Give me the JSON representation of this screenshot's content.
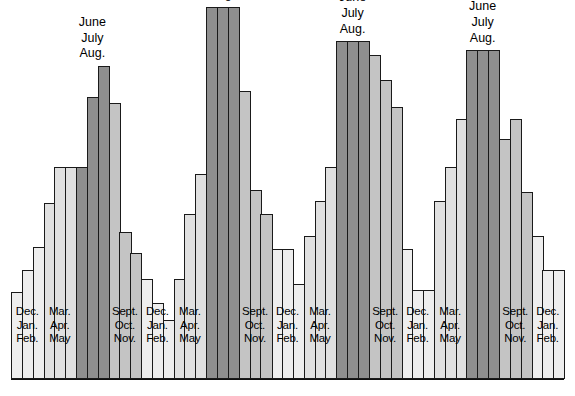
{
  "figure": {
    "title": "",
    "baseline_visible": true
  },
  "legend_colors": {
    "winter_dec_jan_feb": "#eeeeee",
    "spring_mar_apr_may": "#e0e0e0",
    "summer_jun_jul_aug": "#8f8f8f",
    "autumn_sept_oct_nov": "#c4c4c4",
    "outline": "#1a1a1a"
  },
  "season_labels": {
    "winter": [
      "Dec.",
      "Jan.",
      "Feb."
    ],
    "spring": [
      "Mar.",
      "Apr.",
      "May"
    ],
    "summer": [
      "June",
      "July",
      "Aug."
    ],
    "autumn": [
      "Sept.",
      "Oct.",
      "Nov."
    ]
  },
  "chart_data": {
    "type": "bar",
    "title": "",
    "xlabel": "",
    "ylabel": "",
    "ylim": [
      0,
      340
    ],
    "grid": false,
    "legend_position": "none",
    "note": "Monthly values grouped into seasonal quarters; summer quarters labeled above the bars.",
    "groups": [
      {
        "season": "winter",
        "label_lines": [
          "Dec.",
          "Jan.",
          "Feb."
        ],
        "label_position": "inside-bottom",
        "fill": "#eeeeee",
        "months": [
          "Dec.",
          "Jan.",
          "Feb."
        ],
        "values": [
          78,
          98,
          118
        ]
      },
      {
        "season": "spring",
        "label_lines": [
          "Mar.",
          "Apr.",
          "May"
        ],
        "label_position": "inside-bottom",
        "fill": "#e0e0e0",
        "months": [
          "Mar.",
          "Apr.",
          "May"
        ],
        "values": [
          158,
          190,
          190
        ]
      },
      {
        "season": "summer",
        "label_lines": [
          "June",
          "July",
          "Aug."
        ],
        "label_position": "top",
        "fill": "#8f8f8f",
        "months": [
          "June",
          "July",
          "Aug."
        ],
        "values": [
          190,
          253,
          281
        ]
      },
      {
        "season": "autumn",
        "label_lines": [
          "Sept.",
          "Oct.",
          "Nov."
        ],
        "label_position": "inside-bottom",
        "fill": "#c4c4c4",
        "months": [
          "Sept.",
          "Oct.",
          "Nov."
        ],
        "values": [
          248,
          132,
          113
        ]
      },
      {
        "season": "winter",
        "label_lines": [
          "Dec.",
          "Jan.",
          "Feb."
        ],
        "label_position": "inside-bottom",
        "fill": "#eeeeee",
        "months": [
          "Dec.",
          "Jan.",
          "Feb."
        ],
        "values": [
          90,
          68,
          53
        ]
      },
      {
        "season": "spring",
        "label_lines": [
          "Mar.",
          "Apr.",
          "May"
        ],
        "label_position": "inside-bottom",
        "fill": "#e0e0e0",
        "months": [
          "Mar.",
          "Apr.",
          "May"
        ],
        "values": [
          90,
          148,
          184
        ]
      },
      {
        "season": "summer",
        "label_lines": [
          "June",
          "July",
          "Aug."
        ],
        "label_position": "top",
        "fill": "#8f8f8f",
        "months": [
          "June",
          "July",
          "Aug."
        ],
        "values": [
          334,
          334,
          334
        ]
      },
      {
        "season": "autumn",
        "label_lines": [
          "Sept.",
          "Oct.",
          "Nov."
        ],
        "label_position": "inside-bottom",
        "fill": "#c4c4c4",
        "months": [
          "Sept.",
          "Oct.",
          "Nov."
        ],
        "values": [
          258,
          170,
          148
        ]
      },
      {
        "season": "winter",
        "label_lines": [
          "Dec.",
          "Jan.",
          "Feb."
        ],
        "label_position": "inside-bottom",
        "fill": "#eeeeee",
        "months": [
          "Dec.",
          "Jan.",
          "Feb."
        ],
        "values": [
          117,
          117,
          85
        ]
      },
      {
        "season": "spring",
        "label_lines": [
          "Mar.",
          "Apr.",
          "May"
        ],
        "label_position": "inside-bottom",
        "fill": "#e0e0e0",
        "months": [
          "Mar.",
          "Apr.",
          "May"
        ],
        "values": [
          128,
          160,
          190
        ]
      },
      {
        "season": "summer",
        "label_lines": [
          "June",
          "July",
          "Aug."
        ],
        "label_position": "top",
        "fill": "#8f8f8f",
        "months": [
          "June",
          "July",
          "Aug."
        ],
        "values": [
          303,
          303,
          303
        ]
      },
      {
        "season": "autumn",
        "label_lines": [
          "Sept.",
          "Oct.",
          "Nov."
        ],
        "label_position": "inside-bottom",
        "fill": "#c4c4c4",
        "months": [
          "Sept.",
          "Oct.",
          "Nov."
        ],
        "values": [
          291,
          268,
          244
        ]
      },
      {
        "season": "winter",
        "label_lines": [
          "Dec.",
          "Jan.",
          "Feb."
        ],
        "label_position": "inside-bottom",
        "fill": "#eeeeee",
        "months": [
          "Dec.",
          "Jan.",
          "Feb."
        ],
        "values": [
          117,
          80,
          80
        ]
      },
      {
        "season": "spring",
        "label_lines": [
          "Mar.",
          "Apr.",
          "May"
        ],
        "label_position": "inside-bottom",
        "fill": "#e0e0e0",
        "months": [
          "Mar.",
          "Apr.",
          "May"
        ],
        "values": [
          160,
          190,
          233
        ]
      },
      {
        "season": "summer",
        "label_lines": [
          "June",
          "July",
          "Aug."
        ],
        "label_position": "top",
        "fill": "#8f8f8f",
        "months": [
          "June",
          "July",
          "Aug."
        ],
        "values": [
          295,
          295,
          295
        ]
      },
      {
        "season": "autumn",
        "label_lines": [
          "Sept.",
          "Oct.",
          "Nov."
        ],
        "label_position": "inside-bottom",
        "fill": "#c4c4c4",
        "months": [
          "Sept.",
          "Oct.",
          "Nov."
        ],
        "values": [
          215,
          233,
          168
        ]
      },
      {
        "season": "winter",
        "label_lines": [
          "Dec.",
          "Jan.",
          "Feb."
        ],
        "label_position": "inside-bottom",
        "fill": "#eeeeee",
        "months": [
          "Dec.",
          "Jan.",
          "Feb."
        ],
        "values": [
          128,
          98,
          98
        ]
      }
    ]
  }
}
